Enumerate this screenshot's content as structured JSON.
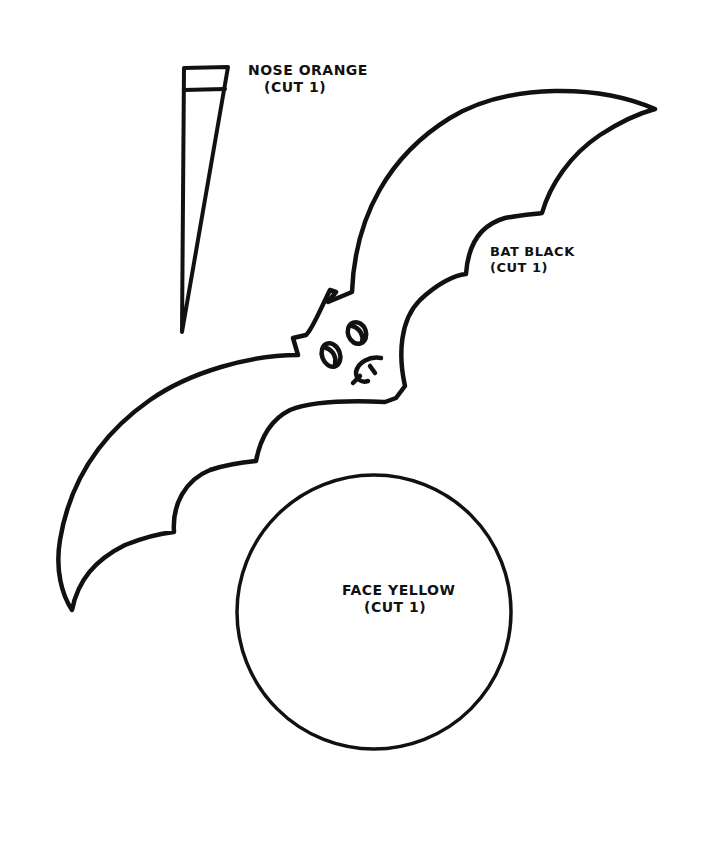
{
  "template": {
    "pieces": [
      {
        "id": "nose",
        "name": "NOSE ORANGE",
        "cut": "(CUT 1)",
        "shape": "tall thin triangle with band at top",
        "color_hint": "orange"
      },
      {
        "id": "bat",
        "name": "BAT BLACK",
        "cut": "(CUT 1)",
        "shape": "bat silhouette with face",
        "color_hint": "black"
      },
      {
        "id": "face",
        "name": "FACE YELLOW",
        "cut": "(CUT 1)",
        "shape": "circle",
        "color_hint": "yellow"
      }
    ]
  },
  "colors": {
    "line": "#111111",
    "background": "#ffffff"
  }
}
